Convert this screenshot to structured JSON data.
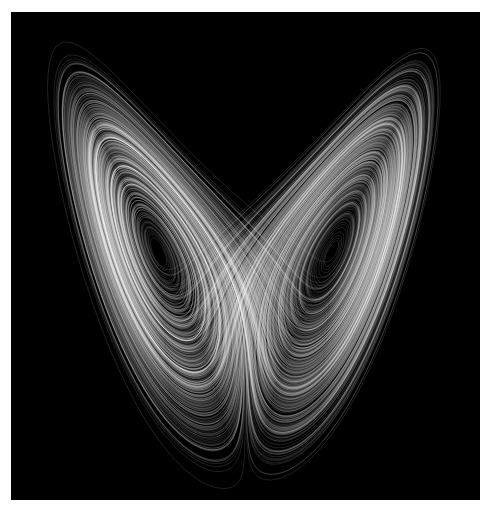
{
  "image": {
    "subject": "Lorenz attractor",
    "background": "#000000",
    "border_color": "#ffffff",
    "stroke_color": "#ffffff",
    "frame": {
      "left": 11,
      "top": 12,
      "width": 469,
      "height": 488
    }
  },
  "lorenz": {
    "sigma": 10,
    "rho": 28,
    "beta": 2.6667,
    "dt": 0.004,
    "steps": 160000,
    "x_range": [
      -22,
      22
    ],
    "z_range": [
      3,
      50
    ]
  }
}
